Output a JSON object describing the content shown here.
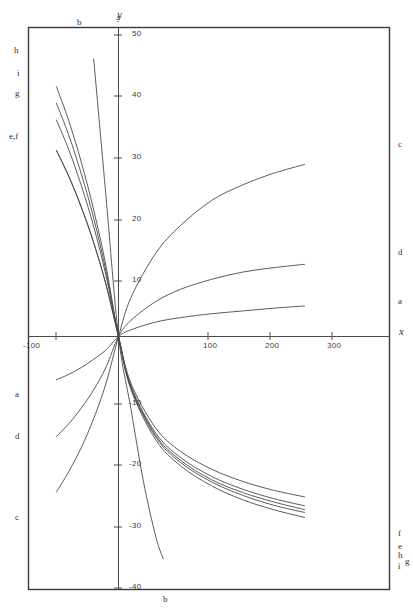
{
  "chart_data": {
    "type": "line",
    "title": "",
    "xlabel": "x",
    "ylabel": "y",
    "xlim": [
      -140,
      330
    ],
    "ylim": [
      -42,
      52
    ],
    "grid": false,
    "legend": "inline-curve-end-labels",
    "xticks": [
      -100,
      100,
      200,
      300
    ],
    "xticklabels": [
      "-100",
      "100",
      "200",
      "300"
    ],
    "yticks": [
      -40,
      -30,
      -20,
      -10,
      10,
      20,
      30,
      40,
      50
    ],
    "yticklabels": [
      "-40",
      "-30",
      "-20",
      "-10",
      "10",
      "20",
      "30",
      "40",
      "50"
    ],
    "origin_note": "all curves pass through (0,0)",
    "series": [
      {
        "name": "a",
        "label_right": "a",
        "label_left": "a",
        "x": [
          -100,
          -80,
          -60,
          -40,
          -20,
          0,
          20,
          60,
          100,
          150,
          200,
          250,
          300
        ],
        "values": [
          -7.8,
          -6.8,
          -5.6,
          -4.1,
          -2.4,
          0,
          1.2,
          2.6,
          3.4,
          4.1,
          4.6,
          5.1,
          5.5
        ]
      },
      {
        "name": "b",
        "label_top": "b",
        "label_bottom": "b",
        "x": [
          -40,
          -20,
          0,
          20,
          40,
          60,
          72
        ],
        "values": [
          50,
          25,
          0,
          -13,
          -26,
          -36,
          -40
        ]
      },
      {
        "name": "c",
        "label_right": "c",
        "label_left": "c",
        "x": [
          -100,
          -80,
          -60,
          -40,
          -20,
          0,
          20,
          60,
          100,
          150,
          200,
          250,
          300
        ],
        "values": [
          -28.0,
          -24.3,
          -20.0,
          -14.8,
          -8.4,
          0,
          7.0,
          15.0,
          20.0,
          24.5,
          27.3,
          29.4,
          31.0
        ]
      },
      {
        "name": "d",
        "label_right": "d",
        "label_left": "d",
        "x": [
          -100,
          -80,
          -60,
          -40,
          -20,
          0,
          20,
          60,
          100,
          150,
          200,
          250,
          300
        ],
        "values": [
          -18.0,
          -15.7,
          -12.9,
          -9.6,
          -5.5,
          0,
          2.9,
          6.3,
          8.5,
          10.3,
          11.6,
          12.4,
          13.0
        ]
      },
      {
        "name": "e",
        "label_right": "e",
        "label_left": "e,f",
        "x": [
          -100,
          -80,
          -60,
          -40,
          -20,
          0,
          20,
          60,
          100,
          150,
          200,
          250,
          300
        ],
        "values": [
          33.5,
          28.8,
          23.3,
          16.9,
          9.3,
          0,
          -8.9,
          -17.4,
          -21.8,
          -25.2,
          -27.5,
          -29.2,
          -30.5
        ]
      },
      {
        "name": "f",
        "label_right": "f",
        "label_left": "e,f",
        "x": [
          -100,
          -80,
          -60,
          -40,
          -20,
          0,
          20,
          60,
          100,
          150,
          200,
          250,
          300
        ],
        "values": [
          33.5,
          28.8,
          23.3,
          16.9,
          9.3,
          0,
          -8.4,
          -16.5,
          -20.7,
          -23.9,
          -26.1,
          -27.7,
          -28.9
        ]
      },
      {
        "name": "g",
        "label_right": "g",
        "label_left": "g",
        "x": [
          -100,
          -80,
          -60,
          -40,
          -20,
          0,
          20,
          60,
          100,
          150,
          200,
          250,
          300
        ],
        "values": [
          39.0,
          33.6,
          27.2,
          19.8,
          10.9,
          0,
          -9.3,
          -18.1,
          -22.7,
          -26.2,
          -28.6,
          -30.4,
          -31.7
        ]
      },
      {
        "name": "h",
        "label_right": "h",
        "label_left": "h",
        "x": [
          -100,
          -80,
          -60,
          -40,
          -20,
          0,
          20,
          60,
          100,
          150,
          200,
          250,
          300
        ],
        "values": [
          45.0,
          38.8,
          31.4,
          22.8,
          12.6,
          0,
          -9.1,
          -17.8,
          -22.3,
          -25.8,
          -28.1,
          -29.8,
          -31.2
        ]
      },
      {
        "name": "i",
        "label_right": "i",
        "label_left": "i",
        "x": [
          -100,
          -80,
          -60,
          -40,
          -20,
          0,
          20,
          60,
          100,
          150,
          200,
          250,
          300
        ],
        "values": [
          42.0,
          36.2,
          29.3,
          21.3,
          11.7,
          0,
          -9.5,
          -18.6,
          -23.3,
          -26.9,
          -29.4,
          -31.2,
          -32.6
        ]
      }
    ]
  },
  "axes": {
    "x_name": "x",
    "y_name": "y"
  },
  "labels": {
    "top": [
      {
        "text": "b",
        "x": 77,
        "y": 17
      },
      {
        "text": "y",
        "x": 117,
        "y": 12
      }
    ],
    "left": [
      {
        "text": "h",
        "x": 14,
        "y": 45
      },
      {
        "text": "i",
        "x": 17,
        "y": 68
      },
      {
        "text": "g",
        "x": 15,
        "y": 88
      },
      {
        "text": "e,f",
        "x": 9,
        "y": 131
      },
      {
        "text": "a",
        "x": 15,
        "y": 389
      },
      {
        "text": "d",
        "x": 15,
        "y": 431
      },
      {
        "text": "c",
        "x": 15,
        "y": 512
      }
    ],
    "right": [
      {
        "text": "c",
        "x": 398,
        "y": 139
      },
      {
        "text": "d",
        "x": 398,
        "y": 247
      },
      {
        "text": "a",
        "x": 398,
        "y": 296
      },
      {
        "text": "f",
        "x": 398,
        "y": 528
      },
      {
        "text": "e",
        "x": 398,
        "y": 541
      },
      {
        "text": "h",
        "x": 398,
        "y": 550
      },
      {
        "text": "g",
        "x": 405,
        "y": 556
      },
      {
        "text": "i",
        "x": 398,
        "y": 561
      }
    ],
    "bottom": [
      {
        "text": "b",
        "x": 163,
        "y": 594
      }
    ],
    "x_axis_name": {
      "text": "x",
      "x": 399,
      "y": 330
    }
  },
  "xticklabels": [
    {
      "text": "-100",
      "x": 23,
      "y": 341
    },
    {
      "text": "100",
      "x": 203,
      "y": 341
    },
    {
      "text": "200",
      "x": 265,
      "y": 341
    },
    {
      "text": "300",
      "x": 327,
      "y": 341
    }
  ],
  "yticklabels": [
    {
      "text": "50",
      "x": 132,
      "y": 29
    },
    {
      "text": "40",
      "x": 132,
      "y": 90
    },
    {
      "text": "30",
      "x": 132,
      "y": 152
    },
    {
      "text": "20",
      "x": 132,
      "y": 214
    },
    {
      "text": "10",
      "x": 132,
      "y": 275
    },
    {
      "text": "-10",
      "x": 129,
      "y": 398
    },
    {
      "text": "-20",
      "x": 129,
      "y": 459
    },
    {
      "text": "-30",
      "x": 129,
      "y": 521
    },
    {
      "text": "-40",
      "x": 129,
      "y": 582
    }
  ],
  "style": {
    "stroke": "#4a4a4a",
    "frame": "#3a3a3a",
    "background": "#ffffff"
  }
}
